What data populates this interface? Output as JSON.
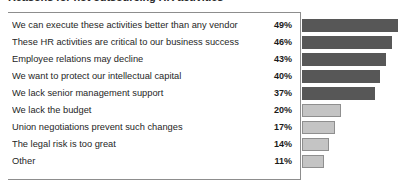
{
  "chart_data": {
    "type": "bar",
    "title": "Reasons for not outsourcing HR activities",
    "xlabel": "",
    "ylabel": "",
    "orientation": "horizontal",
    "xlim": [
      0,
      53
    ],
    "grid": false,
    "legend": null,
    "value_suffix": "%",
    "colors": {
      "dark_bar": "#575757",
      "light_bar": "#c4c4c4",
      "light_bar_border": "#8f8f8f",
      "box_border": "#8d8d8d",
      "label_text": "#262626",
      "value_text": "#1a1a1a",
      "background": "#ffffff"
    },
    "categories": [
      "We can execute these activities better than any vendor",
      "These HR activities are critical to our business success",
      "Employee relations may decline",
      "We want to protect our intellectual capital",
      "We lack senior management support",
      "We lack the budget",
      "Union negotiations prevent such changes",
      "The legal risk is too great",
      "Other"
    ],
    "values": [
      49,
      46,
      43,
      40,
      37,
      20,
      17,
      14,
      11
    ],
    "value_labels": [
      "49%",
      "46%",
      "43%",
      "40%",
      "37%",
      "20%",
      "17%",
      "14%",
      "11%"
    ],
    "bar_styles": [
      "dark",
      "dark",
      "dark",
      "dark",
      "dark",
      "light",
      "light",
      "light",
      "light"
    ]
  }
}
